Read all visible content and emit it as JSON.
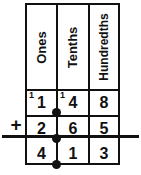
{
  "worksheet": {
    "title": "Decimal place-value column addition",
    "operator": "+",
    "columns": [
      {
        "label": "Ones"
      },
      {
        "label": "Tenths"
      },
      {
        "label": "Hundredths"
      }
    ],
    "rows": [
      {
        "role": "addend-1",
        "digits": [
          "1",
          "4",
          "8"
        ],
        "carries": [
          "1",
          "1",
          ""
        ]
      },
      {
        "role": "addend-2",
        "digits": [
          "2",
          "6",
          "5"
        ],
        "carries": [
          "",
          "",
          ""
        ]
      },
      {
        "role": "sum",
        "digits": [
          "4",
          "1",
          "3"
        ],
        "carries": [
          "",
          "",
          ""
        ]
      }
    ],
    "decimal_points": [
      "·",
      "·",
      "·"
    ],
    "colors": {
      "ink": "#111111",
      "paper": "#ffffff"
    }
  },
  "chart_data": {
    "type": "table",
    "categories": [
      "Ones",
      "Tenths",
      "Hundredths"
    ],
    "series": [
      {
        "name": "addend-1",
        "values": [
          1,
          4,
          8
        ]
      },
      {
        "name": "addend-2",
        "values": [
          2,
          6,
          5
        ]
      },
      {
        "name": "sum",
        "values": [
          4,
          1,
          3
        ]
      }
    ],
    "carries": [
      1,
      1,
      0
    ],
    "equation": "1.48 + 2.65 = 4.13"
  }
}
